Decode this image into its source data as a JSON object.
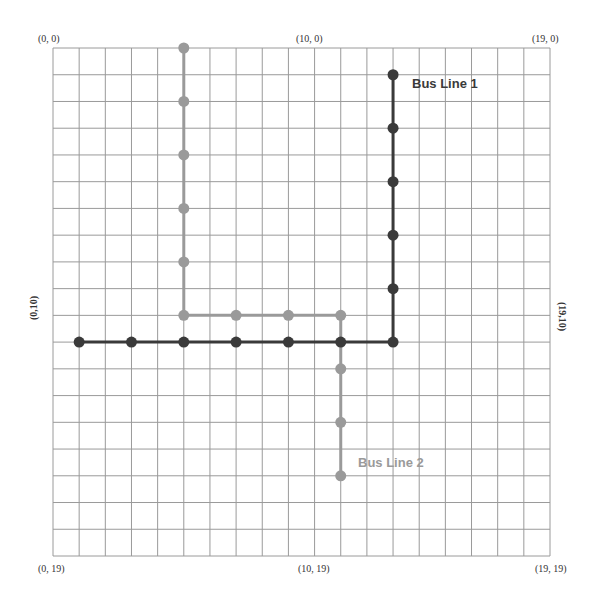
{
  "diagram": {
    "grid": {
      "columns": 19,
      "rows": 19,
      "left": 53,
      "top": 48,
      "width": 497,
      "height": 508,
      "line_color": "#9a9a9a"
    },
    "labels": {
      "top_left": "(0, 0)",
      "top_middle": "(10, 0)",
      "top_right": "(19, 0)",
      "bottom_left": "(0, 19)",
      "bottom_middle": "(10, 19)",
      "bottom_right": "(19, 19)",
      "left_middle": "(0,10)",
      "right_middle": "(19,10)"
    },
    "bus_lines": [
      {
        "name": "Bus Line 1",
        "color": "#3a3a3a",
        "path": [
          [
            1,
            11
          ],
          [
            13,
            11
          ],
          [
            13,
            1
          ]
        ],
        "stops": [
          [
            1,
            11
          ],
          [
            3,
            11
          ],
          [
            5,
            11
          ],
          [
            7,
            11
          ],
          [
            9,
            11
          ],
          [
            11,
            11
          ],
          [
            13,
            11
          ],
          [
            13,
            9
          ],
          [
            13,
            7
          ],
          [
            13,
            5
          ],
          [
            13,
            3
          ],
          [
            13,
            1
          ]
        ]
      },
      {
        "name": "Bus Line 2",
        "color": "#9a9a9a",
        "path": [
          [
            5,
            0
          ],
          [
            5,
            10
          ],
          [
            11,
            10
          ],
          [
            11,
            16
          ]
        ],
        "stops": [
          [
            5,
            0
          ],
          [
            5,
            2
          ],
          [
            5,
            4
          ],
          [
            5,
            6
          ],
          [
            5,
            8
          ],
          [
            5,
            10
          ],
          [
            7,
            10
          ],
          [
            9,
            10
          ],
          [
            11,
            10
          ],
          [
            11,
            12
          ],
          [
            11,
            14
          ],
          [
            11,
            16
          ]
        ]
      }
    ]
  }
}
